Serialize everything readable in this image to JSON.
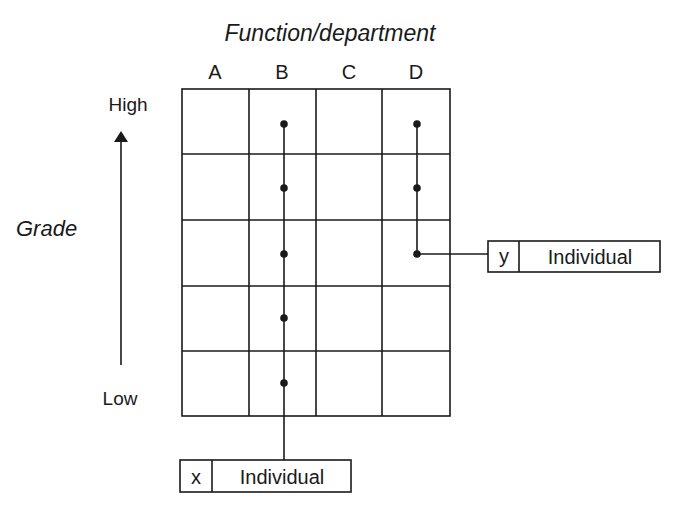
{
  "title": "Function/department",
  "columns": [
    "A",
    "B",
    "C",
    "D"
  ],
  "y_axis": {
    "label": "Grade",
    "high_label": "High",
    "low_label": "Low"
  },
  "grid": {
    "rows": 5,
    "cols": 4
  },
  "career_paths": [
    {
      "id": "x",
      "box_code": "x",
      "box_label": "Individual",
      "column": "B",
      "grades_occupied": [
        1,
        2,
        3,
        4,
        5
      ],
      "exit": "bottom"
    },
    {
      "id": "y",
      "box_code": "y",
      "box_label": "Individual",
      "column": "D",
      "grades_occupied": [
        1,
        2,
        3
      ],
      "exit": "right"
    }
  ],
  "colors": {
    "line": "#1a1a1a",
    "background": "#ffffff"
  }
}
